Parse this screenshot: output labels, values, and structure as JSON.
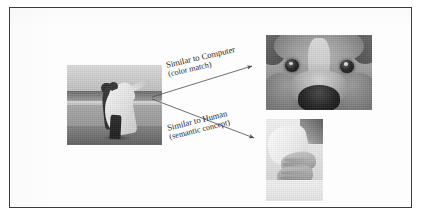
{
  "figure": {
    "kind": "concept-diagram",
    "background_color": "#ffffff",
    "frame_color": "#3c3c40",
    "query": {
      "name": "query-photo",
      "caption": "Photograph of a groom carrying a bride in a white dress on a beach (grayscale)"
    },
    "results": [
      {
        "id": "computer-match",
        "label_line1": "Similar to Computer",
        "label_line2": "(color match)",
        "image_caption": "Extreme close-up of a dog's face and nose (grayscale)"
      },
      {
        "id": "human-match",
        "label_line1": "Similar to Human",
        "label_line2": "(semantic concept)",
        "image_caption": "Close-up of a bride's and groom's clasped hands (grayscale)"
      }
    ],
    "arrows": {
      "stroke_color": "#55555a",
      "origin": {
        "x": 152,
        "y": 97
      },
      "targets": [
        {
          "x": 254,
          "y": 66
        },
        {
          "x": 256,
          "y": 139
        }
      ]
    }
  }
}
